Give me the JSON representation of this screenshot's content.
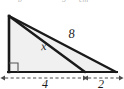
{
  "figure": {
    "name": "right-triangle-with-cevian",
    "type": "geometry-diagram",
    "background_color": "#ffffff",
    "fill_color": "#f0f0f0",
    "stroke_color": "#1a1a1a",
    "dimension_line_color": "#4d4d4d",
    "labels": {
      "hypotenuse": "8",
      "cevian": "x",
      "base_left_segment": "4",
      "base_right_segment": "2"
    },
    "clipped_header": {
      "fragment_1": "b",
      "fragment_2": "5",
      "fragment_3": "cm"
    },
    "geometry": {
      "apex": {
        "x": 9,
        "y": 16
      },
      "right_angle_vertex": {
        "x": 9,
        "y": 72
      },
      "base_mid_vertex": {
        "x": 85,
        "y": 72
      },
      "base_right_vertex": {
        "x": 116,
        "y": 72
      },
      "right_angle_marker_size": 9
    },
    "dimension_line": {
      "y": 78,
      "style": "dashed",
      "segments": [
        {
          "label": "4",
          "from_x": 4,
          "to_x": 84,
          "label_x": 45,
          "label_y": 87
        },
        {
          "label": "2",
          "from_x": 86,
          "to_x": 120,
          "label_x": 101,
          "label_y": 87
        }
      ]
    },
    "label_positions": {
      "cevian": {
        "x": 44,
        "y": 50
      },
      "hypotenuse": {
        "x": 72,
        "y": 38
      }
    }
  }
}
